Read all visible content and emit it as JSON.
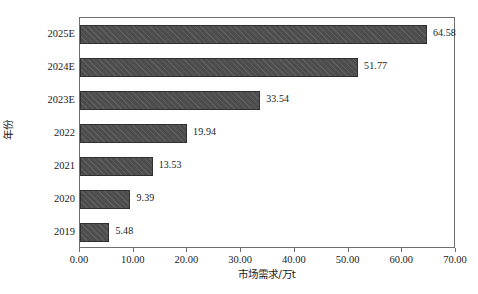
{
  "chart_data": {
    "type": "bar",
    "orientation": "horizontal",
    "title": "",
    "xlabel": "市场需求/万t",
    "ylabel": "年份",
    "categories": [
      "2019",
      "2020",
      "2021",
      "2022",
      "2023E",
      "2024E",
      "2025E"
    ],
    "values": [
      5.48,
      9.39,
      13.53,
      19.94,
      33.54,
      51.77,
      64.58
    ],
    "value_labels": [
      "5.48",
      "9.39",
      "13.53",
      "19.94",
      "33.54",
      "51.77",
      "64.58"
    ],
    "xlim": [
      0,
      70
    ],
    "xtick_labels": [
      "0.00",
      "10.00",
      "20.00",
      "30.00",
      "40.00",
      "50.00",
      "60.00",
      "70.00"
    ],
    "xtick_values": [
      0,
      10,
      20,
      30,
      40,
      50,
      60,
      70
    ],
    "grid": false,
    "legend": null,
    "series": [
      {
        "name": "市场需求",
        "values": [
          5.48,
          9.39,
          13.53,
          19.94,
          33.54,
          51.77,
          64.58
        ]
      }
    ],
    "colors": {
      "bar_fill": "#4d4d4d",
      "bar_border": "#2f2f2f",
      "axis": "#6e6e6e",
      "text": "#1a1a1a",
      "background": "#ffffff"
    }
  },
  "rows": [
    {
      "label": "2025E",
      "value": 64.58,
      "value_label": "64.58"
    },
    {
      "label": "2024E",
      "value": 51.77,
      "value_label": "51.77"
    },
    {
      "label": "2023E",
      "value": 33.54,
      "value_label": "33.54"
    },
    {
      "label": "2022",
      "value": 19.94,
      "value_label": "19.94"
    },
    {
      "label": "2021",
      "value": 13.53,
      "value_label": "13.53"
    },
    {
      "label": "2020",
      "value": 9.39,
      "value_label": "9.39"
    },
    {
      "label": "2019",
      "value": 5.48,
      "value_label": "5.48"
    }
  ]
}
